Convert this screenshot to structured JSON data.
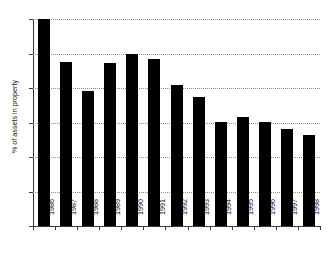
{
  "chart_data": {
    "type": "bar",
    "title": "",
    "xlabel": "",
    "ylabel": "% of assets in property",
    "categories": [
      "1986",
      "1987",
      "1988",
      "1989",
      "1990",
      "1991",
      "1992",
      "1993",
      "1994",
      "1995",
      "1996",
      "1997",
      "1998"
    ],
    "values": [
      12.0,
      9.5,
      7.85,
      9.45,
      9.95,
      9.7,
      8.2,
      7.5,
      6.05,
      6.3,
      6.05,
      5.6,
      5.25
    ],
    "ylim": [
      0,
      12
    ],
    "yticks": [
      0,
      2,
      4,
      6,
      8,
      10,
      12
    ],
    "ytick_labels": [
      "0",
      "2",
      "4",
      "6",
      "8",
      "10",
      "12"
    ],
    "grid": "horizontal-dotted",
    "legend": "none",
    "bar_color": "#000000",
    "axis_color": "#3a3a3a",
    "grid_color": "#8e8e8e"
  },
  "figure": {
    "clipped_title": "",
    "background": "#ffffff"
  }
}
